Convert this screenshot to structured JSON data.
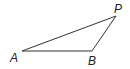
{
  "diagram": {
    "type": "triangle",
    "stroke_color": "#333333",
    "vertices": [
      {
        "label": "A",
        "x": 22,
        "y": 51,
        "label_x": 10,
        "label_y": 62
      },
      {
        "label": "B",
        "x": 92,
        "y": 51,
        "label_x": 88,
        "label_y": 65
      },
      {
        "label": "P",
        "x": 116,
        "y": 16,
        "label_x": 114,
        "label_y": 13
      }
    ]
  }
}
